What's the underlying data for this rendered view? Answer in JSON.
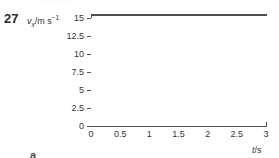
{
  "figure": {
    "question_number": "27",
    "part_label": "a",
    "scan_remnant_text": "…  …  ……"
  },
  "chart_data": {
    "type": "line",
    "title": "",
    "xlabel": "t/s",
    "ylabel": "v_x/m s^-1",
    "ylabel_parts": {
      "symbol": "v",
      "subscript": "x",
      "separator": "/",
      "unit": "m s",
      "unit_exponent": "−1"
    },
    "xlabel_parts": {
      "symbol": "t",
      "separator": "/",
      "unit": "s"
    },
    "x": [
      0,
      3
    ],
    "xlim": [
      0,
      3
    ],
    "ylim": [
      0,
      16.2
    ],
    "xticks": [
      "0",
      "0.5",
      "1",
      "1.5",
      "2",
      "2.5",
      "3"
    ],
    "xtick_values": [
      0,
      0.5,
      1,
      1.5,
      2,
      2.5,
      3
    ],
    "yticks": [
      "0",
      "2.5",
      "5",
      "7.5",
      "10",
      "12.5",
      "15"
    ],
    "ytick_values": [
      0,
      2.5,
      5,
      7.5,
      10,
      12.5,
      15
    ],
    "grid": false,
    "legend": "none",
    "series": [
      {
        "name": "velocity",
        "values": [
          15.5,
          15.5
        ],
        "color": "#4d4d4d",
        "description": "constant horizontal line at about 15.5 m s^-1 across the whole time range"
      }
    ]
  },
  "colors": {
    "axis": "#555555",
    "text": "#333333",
    "series": "#4d4d4d",
    "background": "#ffffff"
  }
}
